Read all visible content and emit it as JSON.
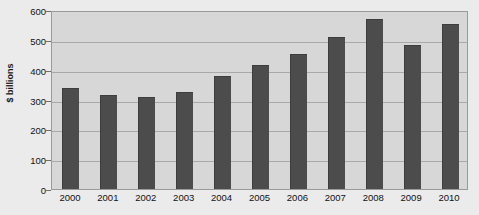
{
  "chart_data": {
    "type": "bar",
    "title": "",
    "subtitle": "",
    "xlabel": "",
    "ylabel": "$ billions",
    "categories": [
      "2000",
      "2001",
      "2002",
      "2003",
      "2004",
      "2005",
      "2006",
      "2007",
      "2008",
      "2009",
      "2010"
    ],
    "values": [
      340,
      315,
      310,
      325,
      380,
      415,
      452,
      510,
      570,
      483,
      552
    ],
    "series": [
      {
        "name": "",
        "values": [
          340,
          315,
          310,
          325,
          380,
          415,
          452,
          510,
          570,
          483,
          552
        ]
      }
    ],
    "ylim": [
      0,
      600
    ],
    "yticks": [
      0,
      100,
      200,
      300,
      400,
      500,
      600
    ],
    "ytick_labels": [
      "0",
      "100",
      "200",
      "300",
      "400",
      "500",
      "600"
    ],
    "grid": true,
    "legend": false,
    "legend_position": "none",
    "bar_color": "#4c4c4c",
    "plot_background": "#d7d7d7",
    "figure_background": "#ebebeb",
    "gridline_color": "#a9a9a9",
    "axis_color": "#9a9a9a",
    "text_color": "#111111"
  }
}
